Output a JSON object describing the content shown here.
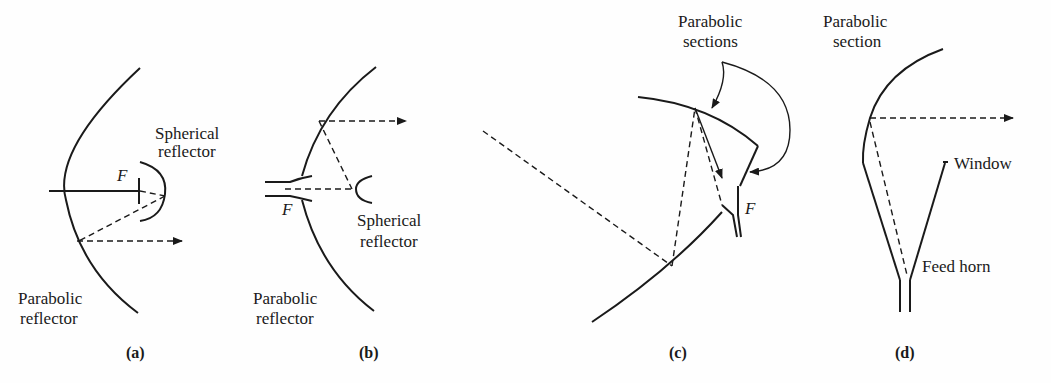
{
  "panels": [
    {
      "id": "a",
      "caption": "(a)",
      "labels": {
        "top": [
          "Spherical",
          "reflector"
        ],
        "bottom": [
          "Parabolic",
          "reflector"
        ],
        "focus": "F"
      }
    },
    {
      "id": "b",
      "caption": "(b)",
      "labels": {
        "top": [
          "Spherical",
          "reflector"
        ],
        "bottom": [
          "Parabolic",
          "reflector"
        ],
        "focus": "F"
      }
    },
    {
      "id": "c",
      "caption": "(c)",
      "labels": {
        "top": [
          "Parabolic",
          "sections"
        ],
        "focus": "F"
      }
    },
    {
      "id": "d",
      "caption": "(d)",
      "labels": {
        "top": [
          "Parabolic",
          "section"
        ],
        "window": "Window",
        "horn": "Feed horn"
      }
    }
  ],
  "colors": {
    "ink": "#1a1a1a",
    "background": "#fefefe"
  }
}
